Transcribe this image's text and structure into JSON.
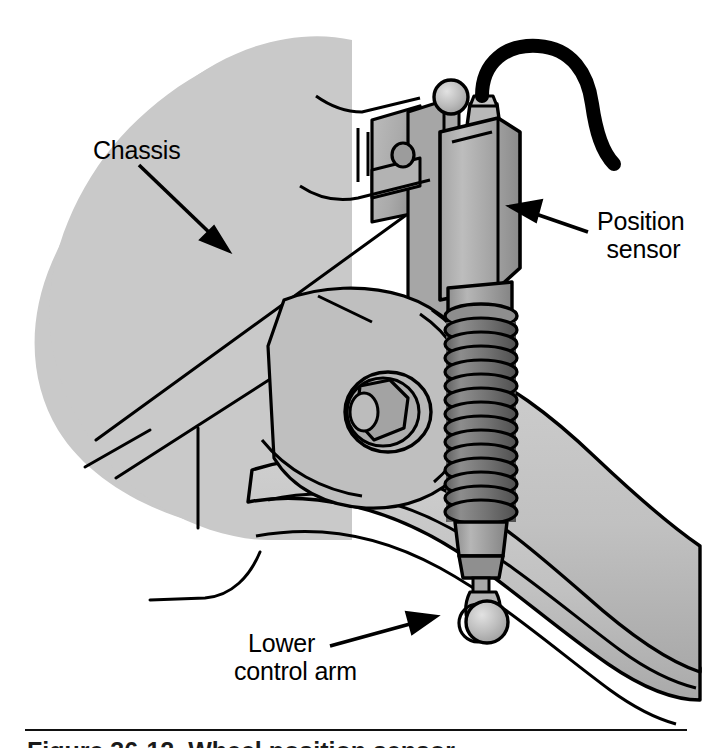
{
  "figure": {
    "caption_partial": "Figure 36-12. Wheel position sensor",
    "background_color": "#ffffff"
  },
  "labels": {
    "chassis": "Chassis",
    "position_sensor_line1": "Position",
    "position_sensor_line2": "sensor",
    "lower_control_arm_line1": "Lower",
    "lower_control_arm_line2": "control arm"
  },
  "colors": {
    "outline": "#000000",
    "chassis_fill": "#c9c9c9",
    "control_arm_fill": "#c2c2c2",
    "control_arm_shade": "#ababab",
    "bracket_fill": "#b5b5b5",
    "bracket_shade": "#9a9a9a",
    "sensor_body_light": "#b0b0b0",
    "sensor_body_dark": "#8f8f8f",
    "bellows_light": "#8a8a8a",
    "bellows_dark": "#6b6b6b",
    "cable": "#000000",
    "ball_stud": "#bdbdbd",
    "white": "#ffffff"
  },
  "parts": [
    {
      "name": "chassis",
      "description": "Light gray chassis rail blob at upper left"
    },
    {
      "name": "position-sensor",
      "description": "Rectangular sensor body with electrical connector and cable"
    },
    {
      "name": "sensor-cable",
      "description": "Black curved electrical cable leaving the sensor connector"
    },
    {
      "name": "sensor-bellows",
      "description": "Dark gray ribbed rubber boot covering the sensor shaft"
    },
    {
      "name": "upper-ball-stud",
      "description": "Ball stud at top left of the sensor"
    },
    {
      "name": "lower-ball-stud",
      "description": "Ball stud joining sensor rod to lower control arm"
    },
    {
      "name": "mounting-bracket",
      "description": "Sensor mounting bracket bolted to the chassis"
    },
    {
      "name": "flange-bolt",
      "description": "Hex flange bolt securing the control arm pivot"
    },
    {
      "name": "lower-control-arm",
      "description": "Curved suspension control arm sweeping to lower right"
    }
  ],
  "annotations": [
    {
      "name": "chassis-leader",
      "label": "Chassis",
      "arrow_direction": "down-right"
    },
    {
      "name": "position-sensor-leader",
      "label": "Position sensor",
      "arrow_direction": "left"
    },
    {
      "name": "lower-control-arm-leader",
      "label": "Lower control arm",
      "arrow_direction": "up-right"
    }
  ]
}
